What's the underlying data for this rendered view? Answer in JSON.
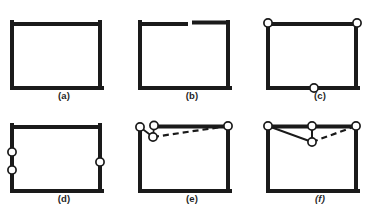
{
  "figure": {
    "type": "line-diagram",
    "background_color": "#ffffff",
    "stroke_color": "#1a1a1a",
    "node_fill_color": "#ffffff",
    "panel_count": 6,
    "panel_width": 128,
    "panel_height": 105,
    "rect": {
      "x": 10,
      "y": 7,
      "width": 92,
      "height": 66
    },
    "edge_thickness": 4,
    "thin_stroke": 1.6,
    "node_radius": 4.1,
    "panels": [
      {
        "id": "a",
        "label": "(a)",
        "label_style": "normal",
        "description": "closed rectangle, no nodes",
        "gap": null,
        "nodes": [],
        "thin_edges": []
      },
      {
        "id": "b",
        "label": "(b)",
        "label_style": "normal",
        "description": "rectangle with gap in top edge",
        "gap": {
          "edge": "top",
          "x_start": 58,
          "x_end": 66,
          "y": 7,
          "right_y_offset": -1.5
        },
        "nodes": [],
        "thin_edges": []
      },
      {
        "id": "c",
        "label": "(c)",
        "label_style": "normal",
        "description": "rectangle with nodes at top-left, top-right and bottom-middle",
        "gap": null,
        "nodes": [
          {
            "name": "node-top-left",
            "x": 10,
            "y": 7
          },
          {
            "name": "node-top-right",
            "x": 102,
            "y": 7
          },
          {
            "name": "node-bottom-middle",
            "x": 58,
            "y": 73
          }
        ],
        "thin_edges": []
      },
      {
        "id": "d",
        "label": "(d)",
        "label_style": "normal",
        "description": "rectangle with two nodes on left edge and one on right edge",
        "gap": null,
        "nodes": [
          {
            "name": "node-left-upper",
            "x": 10,
            "y": 34
          },
          {
            "name": "node-left-lower",
            "x": 10,
            "y": 52
          },
          {
            "name": "node-right-middle",
            "x": 102,
            "y": 44
          }
        ],
        "thin_edges": []
      },
      {
        "id": "e",
        "label": "(e)",
        "label_style": "normal",
        "description": "rectangle with corner node, near-corner node, a dropped node and a dashed chain to the top-right node",
        "gap": null,
        "nodes": [
          {
            "name": "node-top-left",
            "x": 11,
            "y": 8
          },
          {
            "name": "node-top-inner",
            "x": 26,
            "y": 7
          },
          {
            "name": "node-dropped",
            "x": 25,
            "y": 19
          },
          {
            "name": "node-top-right",
            "x": 102,
            "y": 7
          }
        ],
        "thin_edges": [
          {
            "name": "edge-corner-to-dropped",
            "from": [
              11,
              8
            ],
            "to": [
              25,
              19
            ],
            "style": "solid"
          },
          {
            "name": "edge-inner-to-dropped",
            "from": [
              26,
              7
            ],
            "to": [
              25,
              19
            ],
            "style": "solid"
          },
          {
            "name": "edge-dropped-to-top-right",
            "from": [
              25,
              19
            ],
            "to": [
              102,
              7
            ],
            "style": "dashed"
          }
        ]
      },
      {
        "id": "f",
        "label": "(f)",
        "label_style": "italic",
        "description": "rectangle with three top nodes and one dropped node forming a V",
        "gap": null,
        "nodes": [
          {
            "name": "node-top-left",
            "x": 11,
            "y": 7
          },
          {
            "name": "node-top-middle",
            "x": 56,
            "y": 7
          },
          {
            "name": "node-top-right",
            "x": 102,
            "y": 7
          },
          {
            "name": "node-dropped",
            "x": 56,
            "y": 24
          }
        ],
        "thin_edges": [
          {
            "name": "edge-top-left-to-dropped",
            "from": [
              11,
              7
            ],
            "to": [
              56,
              24
            ],
            "style": "solid"
          },
          {
            "name": "edge-top-middle-to-dropped",
            "from": [
              56,
              7
            ],
            "to": [
              56,
              24
            ],
            "style": "solid"
          },
          {
            "name": "edge-dropped-to-top-right",
            "from": [
              56,
              24
            ],
            "to": [
              102,
              7
            ],
            "style": "dashed"
          }
        ]
      }
    ]
  }
}
